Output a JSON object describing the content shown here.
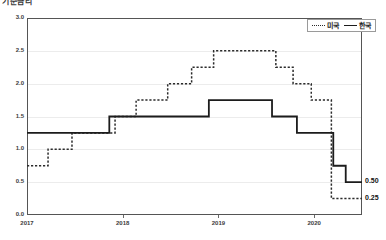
{
  "title": "기준금리",
  "legend": {
    "position": "top-right",
    "entries": [
      {
        "label": "미국",
        "style": "dotted"
      },
      {
        "label": "한국",
        "style": "solid"
      }
    ]
  },
  "end_labels": [
    {
      "value": "0.50",
      "series": "한국"
    },
    {
      "value": "0.25",
      "series": "미국"
    }
  ],
  "chart_data": {
    "type": "line",
    "subtype": "step",
    "title": "기준금리",
    "xlabel": "",
    "ylabel": "",
    "ylim": [
      0.0,
      3.0
    ],
    "xlim": [
      2017.0,
      2020.5
    ],
    "grid": true,
    "legend_position": "top-right",
    "yticks": [
      "0.0",
      "0.5",
      "1.0",
      "1.5",
      "2.0",
      "2.5",
      "3.0"
    ],
    "ytick_values": [
      0.0,
      0.5,
      1.0,
      1.5,
      2.0,
      2.5,
      3.0
    ],
    "xticks": [
      "2017",
      "2018",
      "2019",
      "2020"
    ],
    "xtick_values": [
      2017,
      2018,
      2019,
      2020
    ],
    "series": [
      {
        "name": "미국",
        "style": "dotted",
        "color": "#2b2b2b",
        "final_value": 0.25,
        "x": [
          2017.0,
          2017.22,
          2017.47,
          2017.92,
          2018.14,
          2018.47,
          2018.72,
          2018.95,
          2019.6,
          2019.78,
          2019.97,
          2020.18,
          2020.5
        ],
        "values": [
          0.75,
          1.0,
          1.25,
          1.5,
          1.75,
          2.0,
          2.25,
          2.5,
          2.25,
          2.0,
          1.75,
          0.25,
          0.25
        ]
      },
      {
        "name": "한국",
        "style": "solid",
        "color": "#1c1c1c",
        "final_value": 0.5,
        "x": [
          2017.0,
          2017.86,
          2018.9,
          2019.56,
          2019.82,
          2020.2,
          2020.33,
          2020.5
        ],
        "values": [
          1.25,
          1.5,
          1.75,
          1.5,
          1.25,
          0.75,
          0.5,
          0.5
        ]
      }
    ]
  }
}
